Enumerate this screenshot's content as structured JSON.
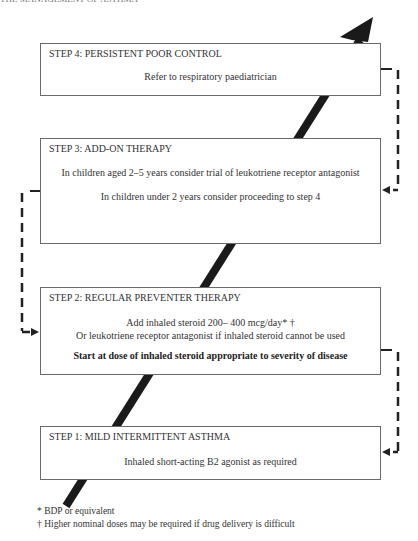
{
  "header": {
    "running_title": "THE MANAGEMENT OF ASTHMA"
  },
  "steps": [
    {
      "id": "step4",
      "title": "STEP 4: PERSISTENT POOR CONTROL",
      "lines": [
        "Refer to respiratory paediatrician"
      ]
    },
    {
      "id": "step3",
      "title": "STEP 3: ADD-ON THERAPY",
      "lines": [
        "In children aged 2–5 years consider trial of leukotriene receptor antagonist",
        "In children under 2 years consider proceeding to step 4"
      ]
    },
    {
      "id": "step2",
      "title": "STEP 2: REGULAR PREVENTER THERAPY",
      "lines": [
        "Add inhaled steroid 200– 400 mcg/day* †",
        "Or leukotriene receptor antagonist if inhaled steroid cannot be used"
      ],
      "emphasis": "Start at dose of inhaled steroid appropriate to severity of disease"
    },
    {
      "id": "step1",
      "title": "STEP 1: MILD INTERMITTENT ASTHMA",
      "lines": [
        "Inhaled short-acting B2 agonist as required"
      ]
    }
  ],
  "footnotes": [
    "* BDP or equivalent",
    "† Higher nominal doses may be required if drug delivery is difficult"
  ],
  "colors": {
    "arrow": "#1a1a1a",
    "border": "#6a6a6a",
    "text": "#333333"
  }
}
